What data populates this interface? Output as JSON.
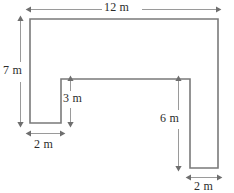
{
  "figure": {
    "kind": "composite-rectilinear-shape",
    "unit": "m",
    "stroke_color": "#7a7a7a",
    "fill_color": "#ffffff",
    "text_color": "#2b2b2b",
    "background_color": "#ffffff",
    "dimensions": {
      "top_width": "12 m",
      "left_height": "7 m",
      "left_leg_width": "2 m",
      "notch_depth": "3 m",
      "right_leg_height": "6 m",
      "right_leg_width": "2 m"
    },
    "outline_points": "30,19 218,19 218,168 190,168 190,79 61,79 61,123 30,123",
    "dimension_lines": [
      {
        "name": "top-12m",
        "orientation": "horizontal",
        "label": "12 m"
      },
      {
        "name": "left-7m",
        "orientation": "vertical",
        "label": "7 m"
      },
      {
        "name": "notch-3m",
        "orientation": "vertical",
        "label": "3 m"
      },
      {
        "name": "left-leg-2m",
        "orientation": "horizontal",
        "label": "2 m"
      },
      {
        "name": "right-leg-6m",
        "orientation": "vertical",
        "label": "6 m"
      },
      {
        "name": "right-leg-2m",
        "orientation": "horizontal",
        "label": "2 m"
      }
    ]
  }
}
